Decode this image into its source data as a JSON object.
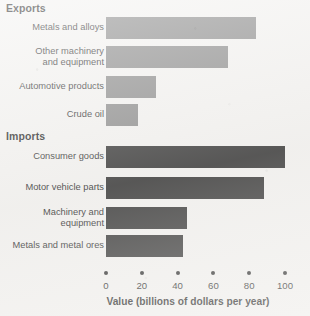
{
  "chart_data": {
    "type": "bar",
    "orientation": "horizontal",
    "title": "",
    "xlabel": "Value (billions of dollars per year)",
    "ylabel": "",
    "xlim": [
      0,
      100
    ],
    "xticks": [
      0,
      20,
      40,
      60,
      80,
      100
    ],
    "xtick_labels": [
      "0",
      "20",
      "40",
      "60",
      "80",
      "100"
    ],
    "grid": false,
    "legend": false,
    "groups": [
      {
        "name": "Exports",
        "color": "#808080",
        "categories": [
          "Metals and alloys",
          "Other machinery\nand equipment",
          "Automotive products",
          "Crude oil"
        ],
        "values": [
          84,
          68,
          28,
          18
        ]
      },
      {
        "name": "Imports",
        "color": "#262626",
        "categories": [
          "Consumer goods",
          "Motor vehicle parts",
          "Machinery and\nequipment",
          "Metals and metal ores"
        ],
        "values": [
          100,
          88,
          45,
          43
        ]
      }
    ]
  },
  "headings": {
    "exports": "Exports",
    "imports": "Imports"
  },
  "axis": {
    "title": "Value (billions of dollars per year)",
    "ticks": [
      "0",
      "20",
      "40",
      "60",
      "80",
      "100"
    ]
  },
  "rows": [
    {
      "label": "Metals and alloys",
      "value": 84,
      "group": "exports"
    },
    {
      "label": "Other machinery\nand equipment",
      "value": 68,
      "group": "exports"
    },
    {
      "label": "Automotive products",
      "value": 28,
      "group": "exports"
    },
    {
      "label": "Crude oil",
      "value": 18,
      "group": "exports"
    },
    {
      "label": "Consumer goods",
      "value": 100,
      "group": "imports"
    },
    {
      "label": "Motor vehicle parts",
      "value": 88,
      "group": "imports"
    },
    {
      "label": "Machinery and\nequipment",
      "value": 45,
      "group": "imports"
    },
    {
      "label": "Metals and metal ores",
      "value": 43,
      "group": "imports"
    }
  ],
  "colors": {
    "exports_bar": "#808080",
    "imports_bar": "#262626",
    "page": "#f2f1ef",
    "text": "#141414"
  }
}
